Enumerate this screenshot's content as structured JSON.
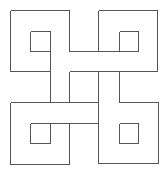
{
  "diagram": {
    "title": "",
    "stroke_color": "#555555",
    "background": "#ffffff",
    "segments": [
      [
        10,
        10,
        69,
        10
      ],
      [
        10,
        10,
        10,
        71
      ],
      [
        10,
        71,
        50,
        71
      ],
      [
        69,
        10,
        69,
        51
      ],
      [
        30,
        31,
        50,
        31
      ],
      [
        50,
        31,
        50,
        51
      ],
      [
        30,
        51,
        50,
        51
      ],
      [
        30,
        31,
        30,
        51
      ],
      [
        50,
        51,
        50,
        102
      ],
      [
        69,
        71,
        69,
        102
      ],
      [
        69,
        51,
        119,
        51
      ],
      [
        69,
        71,
        157,
        71
      ],
      [
        98,
        10,
        157,
        10
      ],
      [
        98,
        10,
        98,
        51
      ],
      [
        157,
        10,
        157,
        71
      ],
      [
        119,
        31,
        138,
        31
      ],
      [
        138,
        31,
        138,
        51
      ],
      [
        119,
        51,
        138,
        51
      ],
      [
        119,
        31,
        119,
        51
      ],
      [
        98,
        71,
        98,
        163
      ],
      [
        119,
        71,
        119,
        102
      ],
      [
        119,
        123,
        119,
        143
      ],
      [
        119,
        102,
        158,
        102
      ],
      [
        158,
        102,
        158,
        163
      ],
      [
        98,
        163,
        158,
        163
      ],
      [
        119,
        123,
        138,
        123
      ],
      [
        138,
        123,
        138,
        143
      ],
      [
        119,
        143,
        138,
        143
      ],
      [
        10,
        102,
        98,
        102
      ],
      [
        50,
        123,
        98,
        123
      ],
      [
        10,
        102,
        10,
        164
      ],
      [
        10,
        164,
        69,
        164
      ],
      [
        69,
        123,
        69,
        164
      ],
      [
        30,
        123,
        50,
        123
      ],
      [
        50,
        123,
        50,
        143
      ],
      [
        30,
        143,
        50,
        143
      ],
      [
        30,
        123,
        30,
        143
      ]
    ]
  }
}
